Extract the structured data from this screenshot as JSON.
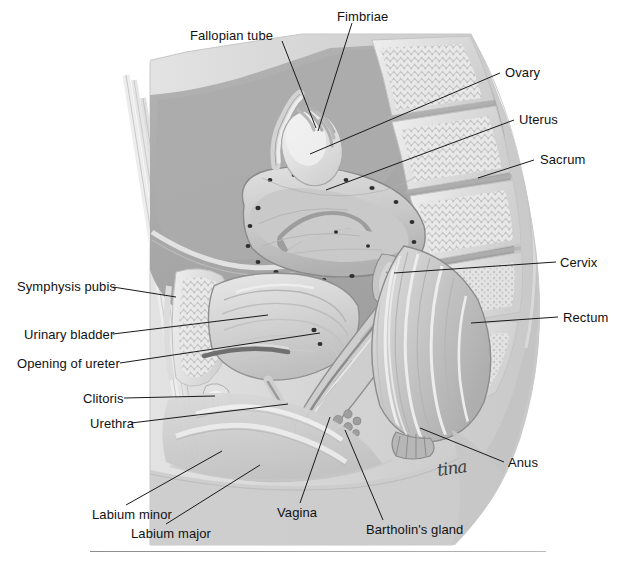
{
  "figure": {
    "signature": "tina",
    "palette": {
      "background": "#ffffff",
      "skin_outline": "#d9d9d9",
      "soft_tissue": "#bdbdbd",
      "muscle_mid": "#a9a9a9",
      "bone_light": "#e6e6e6",
      "bone_speckle": "#c6c6c6",
      "organ_light": "#d2d2d2",
      "organ_dark": "#9a9a9a",
      "highlight": "#f2f2f2",
      "leader_line": "#1a1a1a",
      "label_text": "#111111",
      "rule": "#9b9b9b"
    }
  },
  "labels": [
    {
      "id": "fallopian-tube",
      "text": "Fallopian tube",
      "side": "left",
      "text_x": 190,
      "text_y": 28,
      "line": [
        [
          282,
          41
        ],
        [
          316,
          128
        ]
      ]
    },
    {
      "id": "fimbriae",
      "text": "Fimbriae",
      "side": "left",
      "text_x": 337,
      "text_y": 9,
      "line": [
        [
          352,
          23
        ],
        [
          318,
          131
        ]
      ]
    },
    {
      "id": "ovary",
      "text": "Ovary",
      "side": "right",
      "text_x": 505,
      "text_y": 65,
      "line": [
        [
          500,
          73
        ],
        [
          310,
          154
        ]
      ]
    },
    {
      "id": "uterus",
      "text": "Uterus",
      "side": "right",
      "text_x": 519,
      "text_y": 112,
      "line": [
        [
          514,
          120
        ],
        [
          326,
          190
        ]
      ]
    },
    {
      "id": "sacrum",
      "text": "Sacrum",
      "side": "right",
      "text_x": 540,
      "text_y": 152,
      "line": [
        [
          534,
          160
        ],
        [
          478,
          178
        ]
      ]
    },
    {
      "id": "cervix",
      "text": "Cervix",
      "side": "right",
      "text_x": 560,
      "text_y": 255,
      "line": [
        [
          556,
          262
        ],
        [
          394,
          273
        ]
      ]
    },
    {
      "id": "rectum",
      "text": "Rectum",
      "side": "right",
      "text_x": 563,
      "text_y": 310,
      "line": [
        [
          558,
          317
        ],
        [
          471,
          323
        ]
      ]
    },
    {
      "id": "anus",
      "text": "Anus",
      "side": "right",
      "text_x": 508,
      "text_y": 455,
      "line": [
        [
          504,
          462
        ],
        [
          420,
          428
        ]
      ]
    },
    {
      "id": "symphysis-pubis",
      "text": "Symphysis pubis",
      "side": "left",
      "text_x": 17,
      "text_y": 279,
      "line": [
        [
          113,
          287
        ],
        [
          176,
          297
        ]
      ]
    },
    {
      "id": "urinary-bladder",
      "text": "Urinary bladder",
      "side": "left",
      "text_x": 24,
      "text_y": 327,
      "line": [
        [
          113,
          334
        ],
        [
          268,
          315
        ]
      ]
    },
    {
      "id": "opening-of-ureter",
      "text": "Opening of ureter",
      "side": "left",
      "text_x": 17,
      "text_y": 356,
      "line": [
        [
          120,
          363
        ],
        [
          320,
          333
        ]
      ]
    },
    {
      "id": "clitoris",
      "text": "Clitoris",
      "side": "left",
      "text_x": 83,
      "text_y": 391,
      "line": [
        [
          124,
          398
        ],
        [
          215,
          396
        ]
      ]
    },
    {
      "id": "urethra",
      "text": "Urethra",
      "side": "left",
      "text_x": 90,
      "text_y": 416,
      "line": [
        [
          131,
          423
        ],
        [
          288,
          404
        ]
      ]
    },
    {
      "id": "labium-minor",
      "text": "Labium minor",
      "side": "left",
      "text_x": 92,
      "text_y": 507,
      "line": [
        [
          126,
          505
        ],
        [
          222,
          451
        ]
      ]
    },
    {
      "id": "labium-major",
      "text": "Labium major",
      "side": "left",
      "text_x": 131,
      "text_y": 526,
      "line": [
        [
          166,
          524
        ],
        [
          260,
          465
        ]
      ]
    },
    {
      "id": "vagina",
      "text": "Vagina",
      "side": "left",
      "text_x": 277,
      "text_y": 505,
      "line": [
        [
          300,
          503
        ],
        [
          330,
          417
        ]
      ]
    },
    {
      "id": "bartholins-gland",
      "text": "Bartholin's gland",
      "side": "left",
      "text_x": 366,
      "text_y": 522,
      "line": [
        [
          383,
          520
        ],
        [
          345,
          430
        ]
      ]
    }
  ],
  "rule": {
    "x": 90,
    "y": 551,
    "width": 456
  }
}
